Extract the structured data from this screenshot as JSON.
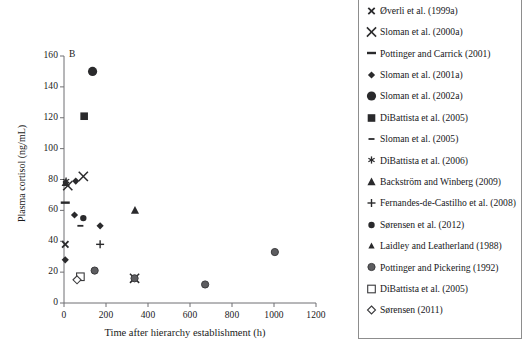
{
  "figure": {
    "panel_letter": "B",
    "marker_color": "#2a2a2c",
    "open_marker_stroke": "#3a3a3c",
    "grey_marker_fill": "#5d5d60",
    "axis_color": "#6f6f72",
    "legend_border_color": "#8d8d8d"
  },
  "chart_data": {
    "type": "scatter",
    "title": "B",
    "xlabel": "Time after hierarchy establishment (h)",
    "ylabel": "Plasma cortisol (ng/mL)",
    "xlim": [
      0,
      1200
    ],
    "ylim": [
      0,
      160
    ],
    "xticks": [
      0,
      200,
      400,
      600,
      800,
      1000,
      1200
    ],
    "yticks": [
      0,
      20,
      40,
      60,
      80,
      100,
      120,
      140,
      160
    ],
    "grid": false,
    "legend_position": "right-outside",
    "series": [
      {
        "name": "Øverli et al. (1999a)",
        "marker": "x-small",
        "points": [
          {
            "x": 6,
            "y": 38
          }
        ]
      },
      {
        "name": "Sloman et al. (2000a)",
        "marker": "x-large",
        "points": [
          {
            "x": 18,
            "y": 76
          },
          {
            "x": 92,
            "y": 82
          },
          {
            "x": 336,
            "y": 16
          }
        ]
      },
      {
        "name": "Pottinger and Carrick (2001)",
        "marker": "dash-thick",
        "points": [
          {
            "x": 6,
            "y": 65
          }
        ]
      },
      {
        "name": "Sloman et al. (2001a)",
        "marker": "diamond-filled",
        "points": [
          {
            "x": 6,
            "y": 28
          },
          {
            "x": 50,
            "y": 57
          },
          {
            "x": 56,
            "y": 79
          },
          {
            "x": 172,
            "y": 50
          }
        ]
      },
      {
        "name": "Sloman et al. (2002a)",
        "marker": "circle-large-filled",
        "points": [
          {
            "x": 136,
            "y": 150
          }
        ]
      },
      {
        "name": "DiBattista et al. (2005)",
        "marker": "square-filled",
        "points": [
          {
            "x": 96,
            "y": 121
          }
        ]
      },
      {
        "name": "Sloman et al. (2005)",
        "marker": "dash-small",
        "points": [
          {
            "x": 78,
            "y": 50
          }
        ]
      },
      {
        "name": "DiBattista et al. (2006)",
        "marker": "asterisk",
        "points": [
          {
            "x": 10,
            "y": 79
          }
        ]
      },
      {
        "name": "Backström and Winberg (2009)",
        "marker": "triangle-filled",
        "points": [
          {
            "x": 8,
            "y": 78
          },
          {
            "x": 338,
            "y": 60
          }
        ]
      },
      {
        "name": "Fernandes-de-Castilho et al. (2008)",
        "marker": "plus",
        "points": [
          {
            "x": 172,
            "y": 38
          }
        ]
      },
      {
        "name": "Sørensen et al. (2012)",
        "marker": "circle-filled",
        "points": [
          {
            "x": 92,
            "y": 55
          }
        ]
      },
      {
        "name": "Laidley and Leatherland (1988)",
        "marker": "triangle-small",
        "points": [
          {
            "x": 336,
            "y": 16
          }
        ]
      },
      {
        "name": "Pottinger and Pickering (1992)",
        "marker": "circle-grey",
        "points": [
          {
            "x": 146,
            "y": 21
          },
          {
            "x": 336,
            "y": 16
          },
          {
            "x": 672,
            "y": 12
          },
          {
            "x": 1004,
            "y": 33
          }
        ]
      },
      {
        "name": "DiBattista et al. (2005)",
        "marker": "square-open",
        "points": [
          {
            "x": 78,
            "y": 17
          }
        ]
      },
      {
        "name": "Sørensen (2011)",
        "marker": "diamond-open",
        "points": [
          {
            "x": 62,
            "y": 15
          }
        ]
      }
    ]
  },
  "axis": {
    "y_title": "Plasma cortisol (ng/mL)",
    "x_title": "Time after hierarchy establishment (h)",
    "y_tick_labels": [
      "0",
      "20",
      "40",
      "60",
      "80",
      "100",
      "120",
      "140",
      "160"
    ],
    "x_tick_labels": [
      "0",
      "200",
      "400",
      "600",
      "800",
      "1000",
      "1200"
    ]
  },
  "legend": {
    "items": [
      {
        "label": "Øverli et al. (1999a)",
        "marker": "x-small",
        "icon_name": "marker-x-small-icon"
      },
      {
        "label": "Sloman et al. (2000a)",
        "marker": "x-large",
        "icon_name": "marker-x-large-icon"
      },
      {
        "label": "Pottinger and Carrick (2001)",
        "marker": "dash-thick",
        "icon_name": "marker-dash-thick-icon"
      },
      {
        "label": "Sloman et al. (2001a)",
        "marker": "diamond-filled",
        "icon_name": "marker-diamond-filled-icon"
      },
      {
        "label": "Sloman et al. (2002a)",
        "marker": "circle-large-filled",
        "icon_name": "marker-circle-large-filled-icon"
      },
      {
        "label": "DiBattista et al. (2005)",
        "marker": "square-filled",
        "icon_name": "marker-square-filled-icon"
      },
      {
        "label": "Sloman et al. (2005)",
        "marker": "dash-small",
        "icon_name": "marker-dash-small-icon"
      },
      {
        "label": "DiBattista et al. (2006)",
        "marker": "asterisk",
        "icon_name": "marker-asterisk-icon"
      },
      {
        "label": "Backström and Winberg (2009)",
        "marker": "triangle-filled",
        "icon_name": "marker-triangle-filled-icon"
      },
      {
        "label": "Fernandes-de-Castilho et al. (2008)",
        "marker": "plus",
        "icon_name": "marker-plus-icon"
      },
      {
        "label": "Sørensen et al. (2012)",
        "marker": "circle-filled",
        "icon_name": "marker-circle-filled-icon"
      },
      {
        "label": "Laidley and Leatherland (1988)",
        "marker": "triangle-small",
        "icon_name": "marker-triangle-small-icon"
      },
      {
        "label": "Pottinger and Pickering (1992)",
        "marker": "circle-grey",
        "icon_name": "marker-circle-grey-icon"
      },
      {
        "label": "DiBattista et al. (2005)",
        "marker": "square-open",
        "icon_name": "marker-square-open-icon"
      },
      {
        "label": "Sørensen (2011)",
        "marker": "diamond-open",
        "icon_name": "marker-diamond-open-icon"
      }
    ]
  }
}
